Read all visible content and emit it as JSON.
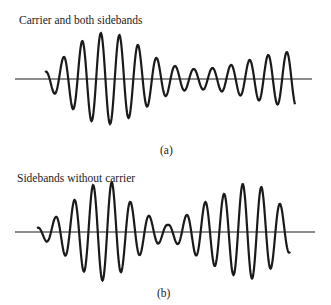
{
  "figure_a": {
    "title": "Carrier and both sidebands",
    "caption": "(a)",
    "axis_y": 79,
    "axis_x": [
      15,
      312
    ],
    "wave": {
      "x_start": 45,
      "x_end": 295,
      "period": 18.6,
      "amplitude_px": [
        7,
        22,
        38,
        46,
        44,
        34,
        21,
        13,
        10,
        11,
        14,
        19,
        24,
        27
      ]
    }
  },
  "figure_b": {
    "title": "Sidebands without carrier",
    "caption": "(b)",
    "axis_y": 232,
    "axis_x": [
      15,
      315
    ],
    "wave": {
      "x_start": 37,
      "x_end": 290,
      "period": 18.7,
      "amplitude_px": [
        4,
        15,
        32,
        47,
        50,
        30,
        16,
        7,
        17,
        30,
        38,
        48,
        45,
        28,
        13,
        5
      ]
    }
  },
  "colors": {
    "stroke": "#1a1a1a",
    "background": "#ffffff"
  }
}
